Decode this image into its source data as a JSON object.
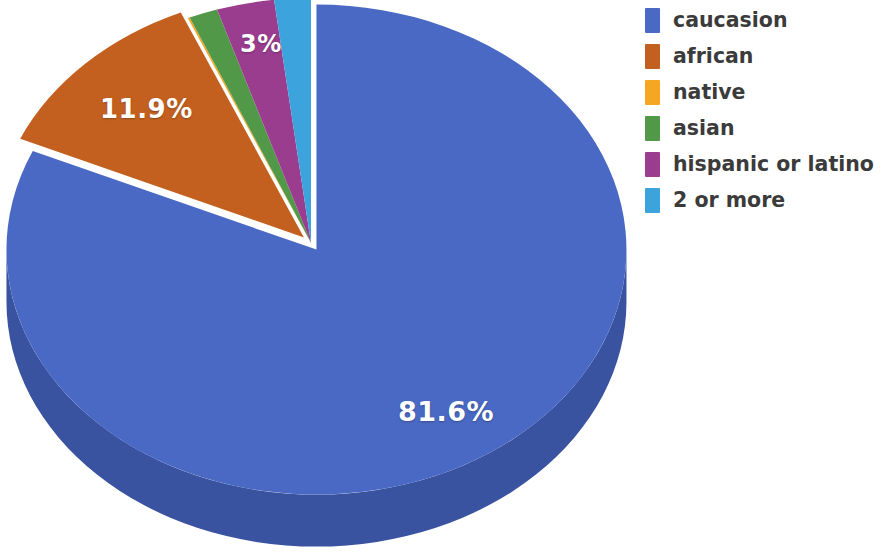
{
  "chart_data": {
    "type": "pie",
    "title": "",
    "subtitle": "",
    "xlabel": "",
    "ylabel": "",
    "three_d": true,
    "start_angle_deg": 90,
    "direction": "clockwise",
    "legend_position": "right",
    "grid": false,
    "categories": [
      "caucasion",
      "african",
      "native",
      "asian",
      "hispanic or latino",
      "2 or more"
    ],
    "values": [
      81.6,
      11.9,
      0.1,
      1.5,
      3.0,
      1.9
    ],
    "colors": [
      "#4a69c4",
      "#c4601f",
      "#f5a623",
      "#519848",
      "#9b3d8f",
      "#3da3dc"
    ],
    "side_colors": [
      "#3a53a0",
      "#9c4c18",
      "#c4851c",
      "#417a39",
      "#7c3173",
      "#3082b0"
    ],
    "exploded": [
      true,
      true,
      false,
      false,
      false,
      false
    ],
    "visible_data_labels": [
      {
        "category": "caucasion",
        "text": "81.6%"
      },
      {
        "category": "african",
        "text": "11.9%"
      },
      {
        "category": "hispanic or latino",
        "text": "3%"
      }
    ],
    "label_text_color": "#ffffff"
  },
  "legend": {
    "items": [
      {
        "label": "caucasion",
        "color": "#4a69c4"
      },
      {
        "label": "african",
        "color": "#c4601f"
      },
      {
        "label": "native",
        "color": "#f5a623"
      },
      {
        "label": "asian",
        "color": "#519848"
      },
      {
        "label": "hispanic or latino",
        "color": "#9b3d8f"
      },
      {
        "label": "2 or more",
        "color": "#3da3dc"
      }
    ]
  },
  "labels": {
    "main": "81.6%",
    "second": "11.9%",
    "third": "3%"
  }
}
